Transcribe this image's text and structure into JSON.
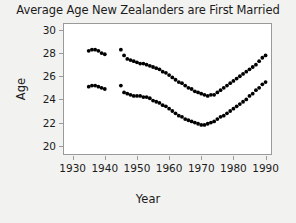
{
  "chart_data": {
    "type": "scatter",
    "title": "Average Age New Zealanders are First Married",
    "xlabel": "Year",
    "ylabel": "Age",
    "xlim": [
      1927,
      1992
    ],
    "ylim": [
      19.2,
      30.6
    ],
    "xticks": [
      1930,
      1940,
      1950,
      1960,
      1970,
      1980,
      1990
    ],
    "yticks": [
      20,
      22,
      24,
      26,
      28,
      30
    ],
    "grid": false,
    "legend": null,
    "marker": "filled-circle",
    "marker_color": "#000000",
    "series": [
      {
        "name": "Men",
        "x": [
          1935,
          1936,
          1937,
          1938,
          1939,
          1940,
          1945,
          1946,
          1947,
          1948,
          1949,
          1950,
          1951,
          1952,
          1953,
          1954,
          1955,
          1956,
          1957,
          1958,
          1959,
          1960,
          1961,
          1962,
          1963,
          1964,
          1965,
          1966,
          1967,
          1968,
          1969,
          1970,
          1971,
          1972,
          1973,
          1974,
          1975,
          1976,
          1977,
          1978,
          1979,
          1980,
          1981,
          1982,
          1983,
          1984,
          1985,
          1986,
          1987,
          1988,
          1989,
          1990
        ],
        "values": [
          28.2,
          28.3,
          28.3,
          28.2,
          28.0,
          27.9,
          28.3,
          27.8,
          27.5,
          27.4,
          27.3,
          27.2,
          27.1,
          27.1,
          27.0,
          26.9,
          26.8,
          26.7,
          26.6,
          26.4,
          26.3,
          26.1,
          25.9,
          25.7,
          25.5,
          25.4,
          25.2,
          25.0,
          24.9,
          24.7,
          24.6,
          24.5,
          24.4,
          24.3,
          24.4,
          24.4,
          24.6,
          24.8,
          25.0,
          25.2,
          25.4,
          25.6,
          25.8,
          26.0,
          26.2,
          26.4,
          26.6,
          26.8,
          27.0,
          27.3,
          27.6,
          27.8
        ]
      },
      {
        "name": "Women",
        "x": [
          1935,
          1936,
          1937,
          1938,
          1939,
          1940,
          1945,
          1946,
          1947,
          1948,
          1949,
          1950,
          1951,
          1952,
          1953,
          1954,
          1955,
          1956,
          1957,
          1958,
          1959,
          1960,
          1961,
          1962,
          1963,
          1964,
          1965,
          1966,
          1967,
          1968,
          1969,
          1970,
          1971,
          1972,
          1973,
          1974,
          1975,
          1976,
          1977,
          1978,
          1979,
          1980,
          1981,
          1982,
          1983,
          1984,
          1985,
          1986,
          1987,
          1988,
          1989,
          1990
        ],
        "values": [
          25.1,
          25.2,
          25.2,
          25.1,
          25.0,
          24.9,
          25.2,
          24.6,
          24.5,
          24.4,
          24.3,
          24.3,
          24.3,
          24.2,
          24.2,
          24.1,
          23.9,
          23.8,
          23.7,
          23.5,
          23.4,
          23.2,
          23.0,
          22.8,
          22.6,
          22.5,
          22.3,
          22.2,
          22.1,
          22.0,
          21.9,
          21.8,
          21.8,
          21.9,
          22.0,
          22.1,
          22.3,
          22.5,
          22.6,
          22.8,
          23.0,
          23.2,
          23.4,
          23.6,
          23.8,
          24.0,
          24.3,
          24.5,
          24.8,
          25.0,
          25.3,
          25.5
        ]
      }
    ]
  }
}
